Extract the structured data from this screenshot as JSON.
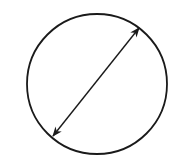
{
  "diagram": {
    "shapes": [
      {
        "kind": "circle",
        "name": "circle"
      },
      {
        "kind": "double-arrow",
        "name": "diameter-arrow",
        "meaning": "diameter"
      }
    ],
    "stroke_color": "#1a1a1a",
    "background_color": "#ffffff"
  }
}
